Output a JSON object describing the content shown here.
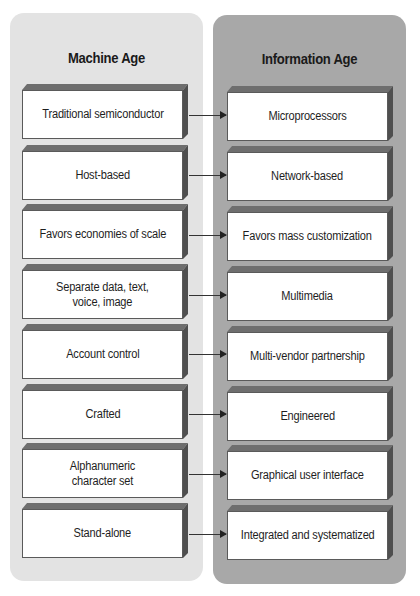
{
  "diagram": {
    "left_column": {
      "title": "Machine Age",
      "background": "#e3e3e3",
      "items": [
        "Traditional semiconductor",
        "Host-based",
        "Favors economies of scale",
        "Separate data, text,\nvoice, image",
        "Account control",
        "Crafted",
        "Alphanumeric\ncharacter set",
        "Stand-alone"
      ]
    },
    "right_column": {
      "title": "Information Age",
      "background": "#a8a8a8",
      "items": [
        "Microprocessors",
        "Network-based",
        "Favors mass customization",
        "Multimedia",
        "Multi-vendor partnership",
        "Engineered",
        "Graphical user interface",
        "Integrated and systematized"
      ]
    },
    "connector": "arrow-right"
  }
}
